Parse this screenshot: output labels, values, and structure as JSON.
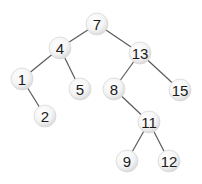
{
  "diagram": {
    "type": "binary-search-tree",
    "colors": {
      "edge": "#5a5a5a",
      "node_fill_center": "#ffffff",
      "node_fill_edge": "#dcdcdc",
      "label": "#1a1a1a",
      "background": "#ffffff"
    },
    "node_radius": 11,
    "nodes": [
      {
        "id": "n7",
        "label": "7",
        "x": 97,
        "y": 24
      },
      {
        "id": "n4",
        "label": "4",
        "x": 60,
        "y": 48
      },
      {
        "id": "n13",
        "label": "13",
        "x": 140,
        "y": 53
      },
      {
        "id": "n1",
        "label": "1",
        "x": 22,
        "y": 79
      },
      {
        "id": "n5",
        "label": "5",
        "x": 80,
        "y": 89
      },
      {
        "id": "n8",
        "label": "8",
        "x": 114,
        "y": 89
      },
      {
        "id": "n15",
        "label": "15",
        "x": 180,
        "y": 90
      },
      {
        "id": "n2",
        "label": "2",
        "x": 45,
        "y": 116
      },
      {
        "id": "n11",
        "label": "11",
        "x": 149,
        "y": 122
      },
      {
        "id": "n9",
        "label": "9",
        "x": 127,
        "y": 161
      },
      {
        "id": "n12",
        "label": "12",
        "x": 169,
        "y": 161
      }
    ],
    "edges": [
      {
        "from": "n7",
        "to": "n4"
      },
      {
        "from": "n7",
        "to": "n13"
      },
      {
        "from": "n4",
        "to": "n1"
      },
      {
        "from": "n4",
        "to": "n5"
      },
      {
        "from": "n1",
        "to": "n2"
      },
      {
        "from": "n13",
        "to": "n8"
      },
      {
        "from": "n13",
        "to": "n15"
      },
      {
        "from": "n8",
        "to": "n11"
      },
      {
        "from": "n11",
        "to": "n9"
      },
      {
        "from": "n11",
        "to": "n12"
      }
    ]
  }
}
